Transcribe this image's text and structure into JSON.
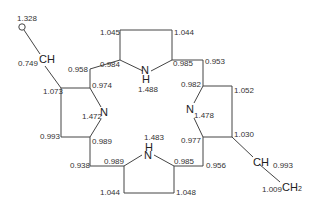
{
  "diagram": {
    "type": "porphyrin-like ring structure with bond/charge annotations",
    "atoms": {
      "o_top": "O",
      "ch_left": "CH",
      "nh_top": {
        "n": "N",
        "h": "H"
      },
      "n_left": "N",
      "n_right": "N",
      "nh_bottom": {
        "n": "N",
        "h": "H"
      },
      "ch_right": "CH",
      "ch2_right": {
        "c": "CH",
        "sub": "2"
      }
    },
    "labels": {
      "o_value": "1.328",
      "ch_left_value": "0.749",
      "top_pyrrole_left_outer": "1.045",
      "top_pyrrole_right_outer": "1.044",
      "top_left_corner": "0.958",
      "top_pyrrole_left_alpha": "0.984",
      "top_pyrrole_right_alpha": "0.985",
      "top_right_corner": "0.953",
      "top_nh_value": "1.488",
      "left_ring_top": "1.073",
      "left_ring_alpha_top": "0.974",
      "right_ring_alpha_top": "0.982",
      "right_ring_top": "1.052",
      "n_left_value": "1.472",
      "n_right_value": "1.478",
      "left_ring_bottom": "0.993",
      "left_ring_alpha_bottom": "0.989",
      "right_ring_alpha_bottom": "0.977",
      "right_ring_bottom": "1.030",
      "bottom_nh_value": "1.483",
      "bottom_left_corner": "0.938",
      "bottom_pyrrole_left_alpha": "0.989",
      "bottom_pyrrole_right_alpha": "0.985",
      "bottom_right_corner": "0.956",
      "ch_right_value": "0.993",
      "bottom_pyrrole_left_outer": "1.044",
      "bottom_pyrrole_right_outer": "1.048",
      "ch2_value": "1.009"
    }
  }
}
